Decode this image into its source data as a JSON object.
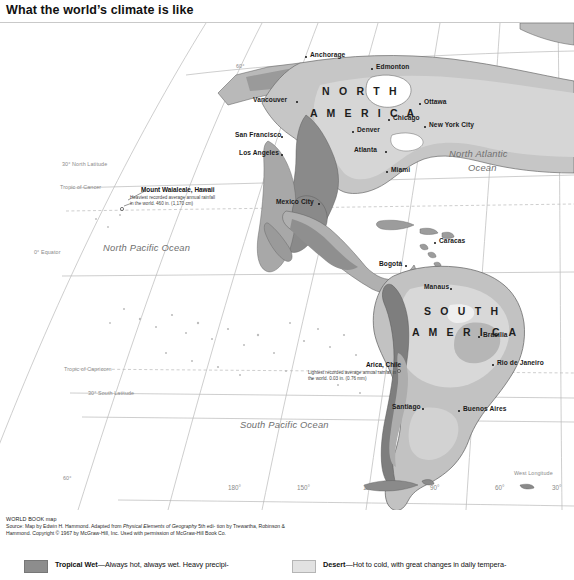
{
  "document": {
    "title": "What the world’s climate is like"
  },
  "map": {
    "name": "world-climate-map-western-hemisphere",
    "continents": [
      {
        "label": "NORTH AMERICA",
        "line1": "N O R T H",
        "line2": "A M E R I C A"
      },
      {
        "label": "SOUTH AMERICA",
        "line1": "S O U T H",
        "line2": "A M E R I C A"
      }
    ],
    "oceans": [
      {
        "name": "North Atlantic Ocean",
        "line1": "North Atlantic",
        "line2": "Ocean"
      },
      {
        "name": "North Pacific Ocean",
        "line1": "North Pacific Ocean"
      },
      {
        "name": "South Pacific Ocean",
        "line1": "South Pacific Ocean"
      }
    ],
    "cities": [
      {
        "name": "Anchorage"
      },
      {
        "name": "Edmonton"
      },
      {
        "name": "Vancouver"
      },
      {
        "name": "Ottawa"
      },
      {
        "name": "Chicago"
      },
      {
        "name": "New York City"
      },
      {
        "name": "Denver"
      },
      {
        "name": "San Francisco"
      },
      {
        "name": "Los Angeles"
      },
      {
        "name": "Atlanta"
      },
      {
        "name": "Miami"
      },
      {
        "name": "Mexico City"
      },
      {
        "name": "Caracas"
      },
      {
        "name": "Bogotá"
      },
      {
        "name": "Manaus"
      },
      {
        "name": "Brasília"
      },
      {
        "name": "Rio de Janeiro"
      },
      {
        "name": "Santiago"
      },
      {
        "name": "Buenos Aires"
      }
    ],
    "callouts": [
      {
        "title": "Mount Waialeale, Hawaii",
        "body": "Heaviest recorded average annual rainfall in the world. 460 in. (1,170 cm)"
      },
      {
        "title": "Arica, Chile",
        "body": "Lightest recorded average annual rainfall in the world. 0.03 in. (0.76 mm)"
      }
    ],
    "graticule": {
      "latitudes": [
        {
          "label": "60°"
        },
        {
          "label": "30° North Latitude"
        },
        {
          "label": "Tropic of Cancer"
        },
        {
          "label": "0° Equator"
        },
        {
          "label": "Tropic of Capricorn"
        },
        {
          "label": "30° South Latitude"
        },
        {
          "label": "60°"
        }
      ],
      "longitudes": [
        {
          "label": "180°"
        },
        {
          "label": "150°"
        },
        {
          "label": "120°"
        },
        {
          "label": "90°"
        },
        {
          "label": "60°"
        },
        {
          "label": "30°"
        }
      ],
      "longitude_caption": "West Longitude"
    }
  },
  "source": {
    "credit": "WORLD BOOK map",
    "line_a": "Source: Map by Edwin H. Hammond. Adapted from ",
    "work": "Physical Elements of Geography",
    "line_b": " 5th edi-",
    "line_c": "tion by Trewartha, Robinson & Hammond. Copyright © 1967 by McGraw-Hill, Inc. Used with",
    "line_d": "permission of McGraw-Hill Book Co."
  },
  "legend": {
    "items": [
      {
        "key": "tropical-wet",
        "term": "Tropical Wet",
        "dash": "—",
        "desc": "Always hot, always wet. Heavy precipi-",
        "swatch": "#8d8d8d"
      },
      {
        "key": "desert",
        "term": "Desert",
        "dash": "—",
        "desc": "Hot to cold, with great changes in daily tempera-",
        "swatch": "#e2e2e2"
      }
    ]
  }
}
